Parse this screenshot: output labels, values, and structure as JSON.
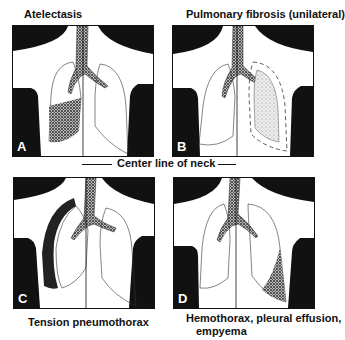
{
  "panels": [
    {
      "letter": "A",
      "title": "Atelectasis"
    },
    {
      "letter": "B",
      "title": "Pulmonary fibrosis (unilateral)"
    },
    {
      "letter": "C",
      "title": "Tension pneumothorax"
    },
    {
      "letter": "D",
      "title_line1": "Hemothorax, pleural effusion,",
      "title_line2": "empyema"
    }
  ],
  "center_label": "Center line of neck",
  "colors": {
    "ink": "#111111",
    "stipple": "#555555"
  }
}
